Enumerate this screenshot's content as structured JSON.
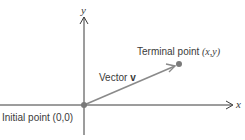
{
  "diagram": {
    "type": "vector-in-coordinate-plane",
    "axes": {
      "x_label": "x",
      "y_label": "y"
    },
    "initial_point": {
      "label": "Initial point (0,0)",
      "label_prefix": "Initial point ",
      "coords": "(0,0)"
    },
    "terminal_point": {
      "label_prefix": "Terminal point ",
      "coords": "(x,y)"
    },
    "vector": {
      "label_prefix": "Vector ",
      "name": "v"
    },
    "colors": {
      "axis": "#3a3a3a",
      "vector": "#8a8a8a",
      "point": "#7a7a7a",
      "text": "#3a3a3a"
    }
  }
}
